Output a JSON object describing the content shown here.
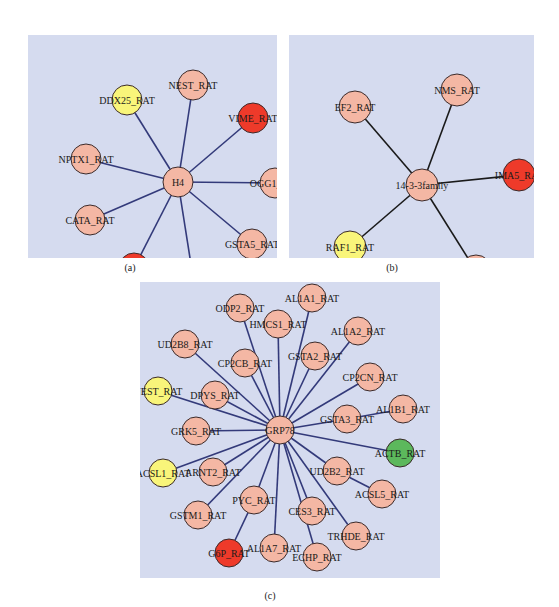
{
  "colors": {
    "background": "#d5dbef",
    "node_default": "#f4b7a4",
    "node_red": "#ee3a2a",
    "node_yellow": "#f9f57a",
    "node_green": "#5cb85c",
    "edge_blue": "#333a7a",
    "edge_black": "#1a1a1a",
    "node_stroke": "#3a2a2a"
  },
  "panels": [
    {
      "id": "a",
      "caption": "(a)",
      "box": {
        "x": 28,
        "y": 35,
        "w": 249,
        "h": 223
      },
      "caption_pos": {
        "x": 130,
        "y": 262
      },
      "edge_color": "edge_blue",
      "radius": 15,
      "hub": {
        "label": "H4",
        "x": 150,
        "y": 147,
        "color": "node_default"
      },
      "nodes": [
        {
          "label": "NEST_RAT",
          "x": 165,
          "y": 50,
          "color": "node_default"
        },
        {
          "label": "DDX25_RAT",
          "x": 99,
          "y": 65,
          "color": "node_yellow"
        },
        {
          "label": "VIME_RAT",
          "x": 225,
          "y": 83,
          "color": "node_red"
        },
        {
          "label": "NPTX1_RAT",
          "x": 58,
          "y": 124,
          "color": "node_default"
        },
        {
          "label": "OGG1_RAT",
          "x": 247,
          "y": 148,
          "color": "node_default"
        },
        {
          "label": "CATA_RAT",
          "x": 62,
          "y": 185,
          "color": "node_default"
        },
        {
          "label": "GSTA5_RAT",
          "x": 224,
          "y": 209,
          "color": "node_default"
        },
        {
          "label": "IMA5_RAT",
          "x": 106,
          "y": 233,
          "color": "node_red"
        },
        {
          "label": "TM196_RAT",
          "x": 165,
          "y": 242,
          "color": "node_default"
        }
      ],
      "extra_edges": []
    },
    {
      "id": "b",
      "caption": "(b)",
      "box": {
        "x": 289,
        "y": 35,
        "w": 245,
        "h": 223
      },
      "caption_pos": {
        "x": 392,
        "y": 262
      },
      "edge_color": "edge_black",
      "radius": 16,
      "hub": {
        "label": "14-3-3family",
        "x": 133,
        "y": 150,
        "color": "node_default"
      },
      "nodes": [
        {
          "label": "NMS_RAT",
          "x": 168,
          "y": 55,
          "color": "node_default"
        },
        {
          "label": "EF2_RAT",
          "x": 66,
          "y": 72,
          "color": "node_default"
        },
        {
          "label": "IMA5_RAT",
          "x": 230,
          "y": 140,
          "color": "node_red"
        },
        {
          "label": "RAF1_RAT",
          "x": 61,
          "y": 212,
          "color": "node_yellow"
        },
        {
          "label": "CARD9_RAT",
          "x": 187,
          "y": 236,
          "color": "node_default"
        }
      ],
      "extra_edges": []
    },
    {
      "id": "c",
      "caption": "(c)",
      "box": {
        "x": 140,
        "y": 282,
        "w": 300,
        "h": 296
      },
      "caption_pos": {
        "x": 270,
        "y": 590
      },
      "edge_color": "edge_blue",
      "radius": 14,
      "hub": {
        "label": "GRP78",
        "x": 140,
        "y": 148,
        "color": "node_default"
      },
      "nodes": [
        {
          "label": "ODP2_RAT",
          "x": 100,
          "y": 26,
          "color": "node_default"
        },
        {
          "label": "AL1A1_RAT",
          "x": 172,
          "y": 16,
          "color": "node_default"
        },
        {
          "label": "HMCS1_RAT",
          "x": 138,
          "y": 42,
          "color": "node_default"
        },
        {
          "label": "AL1A2_RAT",
          "x": 218,
          "y": 49,
          "color": "node_default"
        },
        {
          "label": "UD2B8_RAT",
          "x": 45,
          "y": 62,
          "color": "node_default"
        },
        {
          "label": "CP2CB_RAT",
          "x": 105,
          "y": 81,
          "color": "node_default"
        },
        {
          "label": "GSTA2_RAT",
          "x": 175,
          "y": 74,
          "color": "node_default"
        },
        {
          "label": "CP2CN_RAT",
          "x": 230,
          "y": 95,
          "color": "node_default"
        },
        {
          "label": "NEST_RAT",
          "x": 18,
          "y": 109,
          "color": "node_yellow"
        },
        {
          "label": "DPYS_RAT",
          "x": 75,
          "y": 113,
          "color": "node_default"
        },
        {
          "label": "AL1B1_RAT",
          "x": 263,
          "y": 127,
          "color": "node_default"
        },
        {
          "label": "GSTA3_RAT",
          "x": 207,
          "y": 137,
          "color": "node_default"
        },
        {
          "label": "GRK5_RAT",
          "x": 56,
          "y": 149,
          "color": "node_default"
        },
        {
          "label": "ACTB_RAT",
          "x": 260,
          "y": 171,
          "color": "node_green"
        },
        {
          "label": "ACSL1_RAT",
          "x": 23,
          "y": 191,
          "color": "node_yellow"
        },
        {
          "label": "ARNT2_RAT",
          "x": 73,
          "y": 190,
          "color": "node_default"
        },
        {
          "label": "UD2B2_RAT",
          "x": 197,
          "y": 189,
          "color": "node_default"
        },
        {
          "label": "ACSL5_RAT",
          "x": 242,
          "y": 212,
          "color": "node_default"
        },
        {
          "label": "PYC_RAT",
          "x": 114,
          "y": 218,
          "color": "node_default"
        },
        {
          "label": "GSTM1_RAT",
          "x": 58,
          "y": 233,
          "color": "node_default"
        },
        {
          "label": "CES3_RAT",
          "x": 172,
          "y": 229,
          "color": "node_default"
        },
        {
          "label": "TRHDE_RAT",
          "x": 216,
          "y": 254,
          "color": "node_default"
        },
        {
          "label": "G6P_RAT",
          "x": 89,
          "y": 271,
          "color": "node_red"
        },
        {
          "label": "AL1A7_RAT",
          "x": 134,
          "y": 266,
          "color": "node_default"
        },
        {
          "label": "ECHP_RAT",
          "x": 177,
          "y": 275,
          "color": "node_default"
        }
      ],
      "hub_edges_exclude": [
        "AL1B1_RAT",
        "ACSL5_RAT",
        "G6P_RAT"
      ],
      "extra_edges": [
        [
          "GSTA3_RAT",
          "AL1B1_RAT"
        ],
        [
          "UD2B2_RAT",
          "ACSL5_RAT"
        ],
        [
          "PYC_RAT",
          "G6P_RAT"
        ]
      ]
    }
  ]
}
